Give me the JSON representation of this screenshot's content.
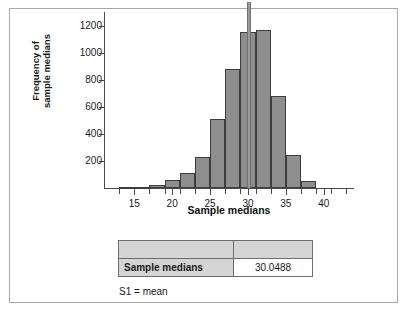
{
  "chart_data": {
    "type": "bar",
    "title": "",
    "subtitle": "",
    "xlabel": "Sample medians",
    "ylabel": "Frequency of sample medians",
    "xlim": [
      11,
      44
    ],
    "ylim": [
      0,
      1300
    ],
    "grid": false,
    "legend": "none",
    "xticks": [
      15,
      20,
      25,
      30,
      35,
      40
    ],
    "xtick_labels": [
      "15",
      "20",
      "25",
      "30",
      "35",
      "40"
    ],
    "yticks": [
      200,
      400,
      600,
      800,
      1000,
      1200
    ],
    "ytick_labels": [
      "200",
      "400",
      "600",
      "800",
      "1000",
      "1200"
    ],
    "bin_width": 2,
    "bin_edges": [
      13,
      15,
      17,
      19,
      21,
      23,
      25,
      27,
      29,
      31,
      33,
      35,
      37,
      39
    ],
    "categories": [
      "13-15",
      "15-17",
      "17-19",
      "19-21",
      "21-23",
      "23-25",
      "25-27",
      "27-29",
      "29-31",
      "31-33",
      "33-35",
      "35-37",
      "37-39"
    ],
    "bin_centers": [
      14,
      16,
      18,
      20,
      22,
      24,
      26,
      28,
      30,
      32,
      34,
      36,
      38
    ],
    "values": [
      5,
      10,
      25,
      60,
      110,
      230,
      510,
      880,
      1150,
      1170,
      680,
      245,
      55
    ],
    "annotations": [
      {
        "name": "mean-marker",
        "type": "vline",
        "x": 30.0488,
        "label": "S1 = mean",
        "color": "#9a9a9a"
      }
    ]
  },
  "axis": {
    "y_title_line1": "Frequency of",
    "y_title_line2": "sample medians",
    "x_title": "Sample medians"
  },
  "results_table": {
    "header": [
      "",
      ""
    ],
    "rows": [
      {
        "label": "Sample medians",
        "value": "30.0488"
      }
    ],
    "footnote_symbol": "S1 =",
    "footnote_text": "mean"
  },
  "colors": {
    "bar_fill": "#8e8e8e",
    "bar_stroke": "#3d3d3d",
    "axis": "#4a4a4a",
    "frame": "#a8a8a8",
    "table_header_bg": "#d4d4d4",
    "marker": "#9a9a9a"
  }
}
